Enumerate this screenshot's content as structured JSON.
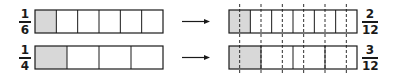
{
  "diagram": {
    "title": "",
    "rows": [
      {
        "left_fraction": {
          "numerator": "1",
          "denominator": "6"
        },
        "parts": 6,
        "shaded": 1,
        "right_fraction": {
          "numerator": "2",
          "denominator": "12"
        },
        "subdivided_parts": 12,
        "subdivided_shaded": 2
      },
      {
        "left_fraction": {
          "numerator": "1",
          "denominator": "4"
        },
        "parts": 4,
        "shaded": 1,
        "right_fraction": {
          "numerator": "3",
          "denominator": "12"
        },
        "subdivided_parts": 12,
        "subdivided_shaded": 3
      }
    ],
    "colors": {
      "stroke": "#1a1a1a",
      "shade": "#d8d8d8"
    }
  }
}
